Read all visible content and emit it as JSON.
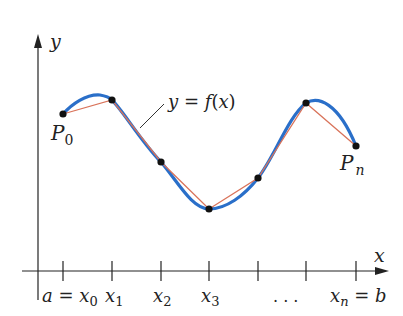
{
  "diagram": {
    "axes": {
      "x_label": "x",
      "y_label": "y"
    },
    "curve_label": {
      "lhs": "y",
      "eq": " = ",
      "fn": "f",
      "paren_open": "(",
      "arg": "x",
      "paren_close": ")"
    },
    "point_labels": {
      "start": {
        "main": "P",
        "sub": "0"
      },
      "end": {
        "main": "P",
        "sub": "n"
      }
    },
    "tick_labels": [
      {
        "pre": "a = ",
        "main": "x",
        "sub": "0",
        "post": ""
      },
      {
        "pre": "",
        "main": "x",
        "sub": "1",
        "post": ""
      },
      {
        "pre": "",
        "main": "x",
        "sub": "2",
        "post": ""
      },
      {
        "pre": "",
        "main": "x",
        "sub": "3",
        "post": ""
      },
      {
        "pre": "",
        "main": ". . .",
        "sub": "",
        "post": ""
      },
      {
        "pre": "",
        "main": "x",
        "sub": "n",
        "post": " = b"
      }
    ],
    "colors": {
      "curve": "#2a6fc9",
      "polygon": "#d9735a",
      "points": "#111111",
      "axes": "#222222"
    },
    "points": [
      {
        "name": "P0",
        "x": 63,
        "y": 114
      },
      {
        "name": "P1",
        "x": 112,
        "y": 100
      },
      {
        "name": "P2",
        "x": 161,
        "y": 162
      },
      {
        "name": "P3",
        "x": 209,
        "y": 209
      },
      {
        "name": "P4",
        "x": 258,
        "y": 178
      },
      {
        "name": "P5",
        "x": 306,
        "y": 103
      },
      {
        "name": "Pn",
        "x": 356,
        "y": 146
      }
    ]
  }
}
